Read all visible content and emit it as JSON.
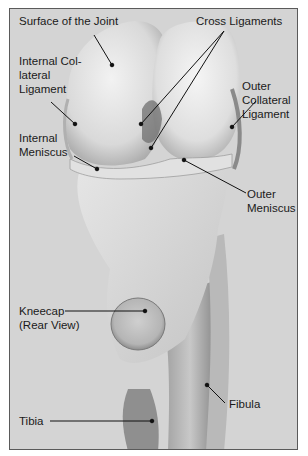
{
  "figure": {
    "labels": [
      {
        "id": "surface-of-the-joint",
        "text": "Surface of the Joint"
      },
      {
        "id": "cross-ligaments",
        "text": "Cross Ligaments"
      },
      {
        "id": "internal-collateral-ligament",
        "text": "Internal Col-\nlateral\nLigament"
      },
      {
        "id": "outer-collateral-ligament",
        "text": "Outer\nCollateral\nLigament"
      },
      {
        "id": "internal-meniscus",
        "text": "Internal\nMeniscus"
      },
      {
        "id": "outer-meniscus",
        "text": "Outer\nMeniscus"
      },
      {
        "id": "kneecap-rear-view",
        "text": "Kneecap\n(Rear View)"
      },
      {
        "id": "fibula",
        "text": "Fibula"
      },
      {
        "id": "tibia",
        "text": "Tibia"
      }
    ]
  }
}
